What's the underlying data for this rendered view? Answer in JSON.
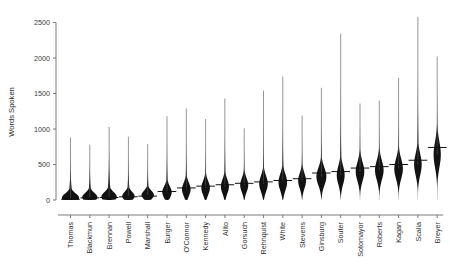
{
  "chart_data": {
    "type": "violin",
    "title": "",
    "subtitle": "",
    "xlabel": "",
    "ylabel": "Words Spoken",
    "ylim": [
      0,
      2500
    ],
    "yticks": [
      0,
      500,
      1000,
      1500,
      2000,
      2500
    ],
    "ytick_labels": [
      "0",
      "500",
      "1000",
      "1500",
      "2000",
      "2500"
    ],
    "grid": false,
    "legend": "none",
    "categories": [
      "Thomas",
      "Blackmun",
      "Brennan",
      "Powell",
      "Marshall",
      "Burger",
      "O'Connor",
      "Kennedy",
      "Alito",
      "Gorsuch",
      "Rehnquist",
      "White",
      "Stevens",
      "Ginsburg",
      "Souter",
      "Sotomayor",
      "Roberts",
      "Kagan",
      "Scalia",
      "Breyer"
    ],
    "series": [
      {
        "name": "Words Spoken per case",
        "median": [
          10,
          30,
          35,
          45,
          55,
          120,
          170,
          195,
          215,
          235,
          255,
          275,
          300,
          380,
          400,
          450,
          470,
          500,
          560,
          740
        ],
        "max": [
          880,
          780,
          1030,
          890,
          790,
          1180,
          1290,
          1140,
          1430,
          1010,
          1540,
          1740,
          1190,
          1580,
          2340,
          1360,
          1400,
          1720,
          2580,
          2020
        ],
        "min": [
          0,
          0,
          0,
          0,
          0,
          0,
          0,
          0,
          0,
          0,
          0,
          0,
          0,
          0,
          0,
          0,
          0,
          0,
          0,
          0
        ],
        "peak_width": [
          1.0,
          0.88,
          0.9,
          0.72,
          0.72,
          0.55,
          0.5,
          0.5,
          0.47,
          0.47,
          0.5,
          0.5,
          0.46,
          0.58,
          0.46,
          0.5,
          0.5,
          0.5,
          0.44,
          0.42
        ],
        "peak_value": [
          30,
          40,
          45,
          55,
          70,
          110,
          150,
          170,
          190,
          210,
          230,
          250,
          270,
          330,
          350,
          400,
          420,
          440,
          500,
          640
        ],
        "spread": [
          115,
          110,
          120,
          110,
          110,
          150,
          170,
          175,
          180,
          175,
          200,
          210,
          195,
          225,
          235,
          240,
          245,
          255,
          275,
          330
        ]
      }
    ]
  },
  "axis": {
    "y_axis_name": "y-axis",
    "x_axis_name": "x-axis"
  }
}
